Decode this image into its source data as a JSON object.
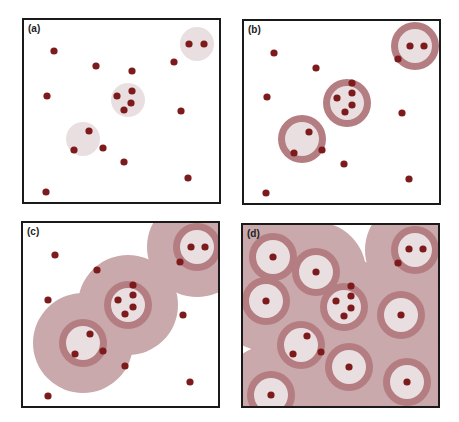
{
  "colors": {
    "dot": "#7d1a1c",
    "light_circle": "#e9dfe1",
    "ring": "#b47d82",
    "halo": "#c9a9ab",
    "border": "#1a1a1a"
  },
  "panels": [
    {
      "label": "(a)",
      "box": {
        "x": 22,
        "y": 18,
        "w": 199,
        "h": 186
      },
      "halos": [],
      "rings": [],
      "zones": [
        {
          "cx": 197,
          "cy": 44,
          "r": 17
        },
        {
          "cx": 128,
          "cy": 100,
          "r": 17
        },
        {
          "cx": 83,
          "cy": 139,
          "r": 17
        }
      ],
      "dots": [
        [
          54,
          51
        ],
        [
          96,
          66
        ],
        [
          132,
          71
        ],
        [
          174,
          62
        ],
        [
          189,
          44
        ],
        [
          204,
          44
        ],
        [
          47,
          96
        ],
        [
          117,
          96
        ],
        [
          132,
          91
        ],
        [
          131,
          103
        ],
        [
          124,
          110
        ],
        [
          181,
          111
        ],
        [
          89,
          131
        ],
        [
          74,
          150
        ],
        [
          103,
          148
        ],
        [
          124,
          162
        ],
        [
          188,
          178
        ],
        [
          46,
          192
        ]
      ]
    },
    {
      "label": "(b)",
      "box": {
        "x": 242,
        "y": 19,
        "w": 199,
        "h": 186
      },
      "halos": [],
      "rings": [
        {
          "cx": 415,
          "cy": 46,
          "r": 24
        },
        {
          "cx": 347,
          "cy": 103,
          "r": 24
        },
        {
          "cx": 302,
          "cy": 139,
          "r": 24
        }
      ],
      "zones": [],
      "dots": [
        [
          274,
          53
        ],
        [
          316,
          68
        ],
        [
          352,
          83
        ],
        [
          398,
          59
        ],
        [
          410,
          46
        ],
        [
          424,
          46
        ],
        [
          267,
          97
        ],
        [
          337,
          98
        ],
        [
          352,
          93
        ],
        [
          352,
          105
        ],
        [
          345,
          112
        ],
        [
          402,
          113
        ],
        [
          309,
          132
        ],
        [
          294,
          153
        ],
        [
          322,
          150
        ],
        [
          344,
          164
        ],
        [
          409,
          179
        ],
        [
          266,
          193
        ]
      ]
    },
    {
      "label": "(c)",
      "box": {
        "x": 21,
        "y": 221,
        "w": 199,
        "h": 187
      },
      "halos": [
        {
          "cx": 83,
          "cy": 343,
          "r": 50
        },
        {
          "cx": 128,
          "cy": 305,
          "r": 50
        },
        {
          "cx": 197,
          "cy": 247,
          "r": 50
        }
      ],
      "rings": [
        {
          "cx": 197,
          "cy": 247,
          "r": 24
        },
        {
          "cx": 128,
          "cy": 305,
          "r": 24
        },
        {
          "cx": 83,
          "cy": 343,
          "r": 24
        }
      ],
      "zones": [],
      "dots": [
        [
          55,
          255
        ],
        [
          97,
          270
        ],
        [
          133,
          285
        ],
        [
          180,
          262
        ],
        [
          191,
          247
        ],
        [
          205,
          247
        ],
        [
          48,
          300
        ],
        [
          118,
          300
        ],
        [
          133,
          295
        ],
        [
          133,
          307
        ],
        [
          125,
          314
        ],
        [
          183,
          315
        ],
        [
          90,
          334
        ],
        [
          75,
          354
        ],
        [
          103,
          351
        ],
        [
          125,
          366
        ],
        [
          190,
          382
        ],
        [
          48,
          396
        ]
      ]
    },
    {
      "label": "(d)",
      "box": {
        "x": 241,
        "y": 223,
        "w": 199,
        "h": 185
      },
      "halos": [
        {
          "cx": 273,
          "cy": 257,
          "r": 50
        },
        {
          "cx": 316,
          "cy": 272,
          "r": 50
        },
        {
          "cx": 266,
          "cy": 301,
          "r": 50
        },
        {
          "cx": 344,
          "cy": 307,
          "r": 50
        },
        {
          "cx": 415,
          "cy": 250,
          "r": 50
        },
        {
          "cx": 401,
          "cy": 315,
          "r": 50
        },
        {
          "cx": 301,
          "cy": 345,
          "r": 50
        },
        {
          "cx": 349,
          "cy": 367,
          "r": 50
        },
        {
          "cx": 407,
          "cy": 382,
          "r": 50
        },
        {
          "cx": 271,
          "cy": 395,
          "r": 50
        }
      ],
      "rings": [
        {
          "cx": 273,
          "cy": 257,
          "r": 24
        },
        {
          "cx": 316,
          "cy": 272,
          "r": 24
        },
        {
          "cx": 266,
          "cy": 301,
          "r": 24
        },
        {
          "cx": 344,
          "cy": 307,
          "r": 24
        },
        {
          "cx": 415,
          "cy": 250,
          "r": 24
        },
        {
          "cx": 401,
          "cy": 315,
          "r": 24
        },
        {
          "cx": 301,
          "cy": 345,
          "r": 24
        },
        {
          "cx": 349,
          "cy": 367,
          "r": 24
        },
        {
          "cx": 407,
          "cy": 382,
          "r": 24
        },
        {
          "cx": 271,
          "cy": 395,
          "r": 24
        }
      ],
      "zones": [],
      "dots": [
        [
          273,
          257
        ],
        [
          316,
          272
        ],
        [
          351,
          286
        ],
        [
          398,
          263
        ],
        [
          409,
          249
        ],
        [
          423,
          249
        ],
        [
          266,
          301
        ],
        [
          336,
          301
        ],
        [
          351,
          296
        ],
        [
          351,
          308
        ],
        [
          344,
          316
        ],
        [
          401,
          315
        ],
        [
          307,
          336
        ],
        [
          293,
          354
        ],
        [
          321,
          352
        ],
        [
          349,
          367
        ],
        [
          407,
          382
        ],
        [
          271,
          395
        ]
      ]
    }
  ]
}
